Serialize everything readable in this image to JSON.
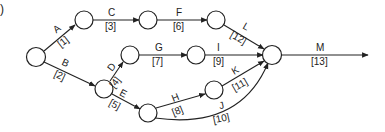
{
  "part_label": ")",
  "nodes": [
    {
      "id": "n1",
      "x": 36,
      "y": 57
    },
    {
      "id": "n2",
      "x": 84,
      "y": 20
    },
    {
      "id": "n3",
      "x": 148,
      "y": 20
    },
    {
      "id": "n4",
      "x": 216,
      "y": 20
    },
    {
      "id": "n5",
      "x": 130,
      "y": 55
    },
    {
      "id": "n6",
      "x": 196,
      "y": 55
    },
    {
      "id": "n7",
      "x": 104,
      "y": 89
    },
    {
      "id": "n8",
      "x": 148,
      "y": 113
    },
    {
      "id": "n9",
      "x": 214,
      "y": 90
    },
    {
      "id": "n10",
      "x": 272,
      "y": 55
    }
  ],
  "activities": [
    {
      "name": "A",
      "duration": "[1]"
    },
    {
      "name": "B",
      "duration": "[2]"
    },
    {
      "name": "C",
      "duration": "[3]"
    },
    {
      "name": "D",
      "duration": "[4]"
    },
    {
      "name": "E",
      "duration": "[5]"
    },
    {
      "name": "F",
      "duration": "[6]"
    },
    {
      "name": "G",
      "duration": "[7]"
    },
    {
      "name": "H",
      "duration": "[8]"
    },
    {
      "name": "I",
      "duration": "[9]"
    },
    {
      "name": "J",
      "duration": "[10]"
    },
    {
      "name": "K",
      "duration": "[11]"
    },
    {
      "name": "L",
      "duration": "[12]"
    },
    {
      "name": "M",
      "duration": "[13]"
    }
  ]
}
